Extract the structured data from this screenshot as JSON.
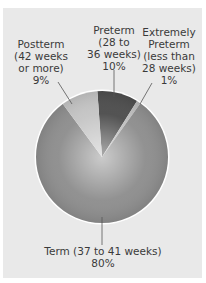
{
  "chart_data": {
    "type": "pie",
    "title": "",
    "slices": [
      {
        "label": "Preterm (28 to 36 weeks)",
        "value": 10,
        "color": "#4a4a4a"
      },
      {
        "label": "Extremely Preterm (less than 28 weeks)",
        "value": 1,
        "color": "#bdbdbd"
      },
      {
        "label": "Term (37 to 41 weeks)",
        "value": 80,
        "color": "#8c8c8c"
      },
      {
        "label": "Postterm (42 weeks or more)",
        "value": 9,
        "color": "#c4c4c4"
      }
    ],
    "legend": "none (callout labels)"
  },
  "labels": {
    "postterm": {
      "line1": "Postterm",
      "line2": "(42 weeks",
      "line3": "or more)",
      "pct": "9%"
    },
    "preterm": {
      "line1": "Preterm",
      "line2": "(28 to",
      "line3": "36 weeks)",
      "pct": "10%"
    },
    "extremely": {
      "line1": "Extremely",
      "line2": "Preterm",
      "line3": "(less than",
      "line4": "28 weeks)",
      "pct": "1%"
    },
    "term": {
      "line1": "Term (37 to 41 weeks)",
      "pct": "80%"
    }
  }
}
